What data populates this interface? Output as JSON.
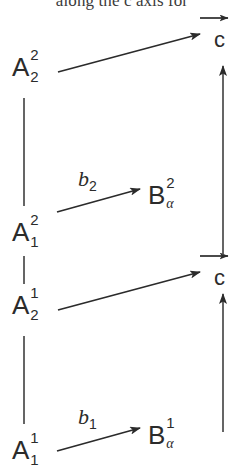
{
  "page": {
    "width": 244,
    "height": 473,
    "background": "#ffffff",
    "ink": "#2b2b2b"
  },
  "header": {
    "clipped_caption": "along the c axis for"
  },
  "diagram": {
    "type": "commutative-diagram",
    "nodes": [
      {
        "id": "A-2-2",
        "letter": "A",
        "superscript": "2",
        "subscript": "2",
        "x": 12,
        "y": 72
      },
      {
        "id": "A-1-2",
        "letter": "A",
        "superscript": "2",
        "subscript": "1",
        "x": 12,
        "y": 237
      },
      {
        "id": "A-2-1",
        "letter": "A",
        "superscript": "1",
        "subscript": "2",
        "x": 12,
        "y": 310
      },
      {
        "id": "A-1-1",
        "letter": "A",
        "superscript": "1",
        "subscript": "1",
        "x": 12,
        "y": 455
      },
      {
        "id": "B-alpha-2",
        "letter": "B",
        "superscript": "2",
        "subscript": "α",
        "x": 148,
        "y": 200
      },
      {
        "id": "B-alpha-1",
        "letter": "B",
        "superscript": "1",
        "subscript": "α",
        "x": 148,
        "y": 440
      }
    ],
    "targets": [
      {
        "id": "c-top",
        "label": "c",
        "x": 212,
        "y": 45
      },
      {
        "id": "c-bottom",
        "label": "c",
        "x": 212,
        "y": 283
      }
    ],
    "arrow_labels": [
      {
        "id": "b-2",
        "base": "b",
        "subscript": "2",
        "x": 78,
        "y": 182
      },
      {
        "id": "b-1",
        "base": "b",
        "subscript": "1",
        "x": 78,
        "y": 420
      }
    ]
  }
}
